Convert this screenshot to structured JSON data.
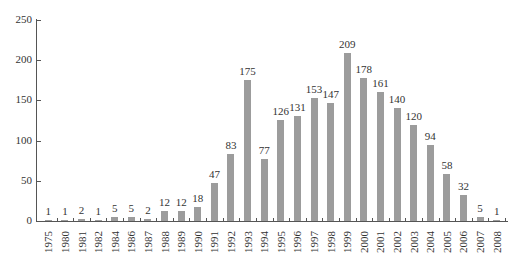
{
  "chart_data": {
    "type": "bar",
    "title": "",
    "xlabel": "",
    "ylabel": "",
    "categories": [
      "1975",
      "1980",
      "1981",
      "1982",
      "1984",
      "1986",
      "1987",
      "1988",
      "1989",
      "1990",
      "1991",
      "1992",
      "1993",
      "1994",
      "1995",
      "1996",
      "1997",
      "1998",
      "1999",
      "2000",
      "2001",
      "2002",
      "2003",
      "2004",
      "2005",
      "2006",
      "2007",
      "2008"
    ],
    "values": [
      1,
      1,
      2,
      1,
      5,
      5,
      2,
      12,
      12,
      18,
      47,
      83,
      175,
      77,
      126,
      131,
      153,
      147,
      209,
      178,
      161,
      140,
      120,
      94,
      58,
      32,
      5,
      1
    ],
    "ylim": [
      0,
      250
    ],
    "yticks": [
      0,
      50,
      100,
      150,
      200,
      250
    ],
    "grid": false,
    "legend": null,
    "bar_color": "#9c9c9c"
  }
}
